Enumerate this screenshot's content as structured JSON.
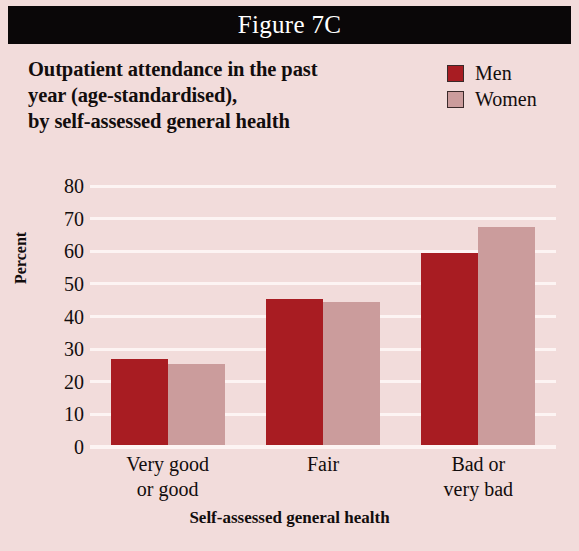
{
  "figure": {
    "banner_label": "Figure 7C",
    "banner_color": "#0a0708",
    "background_color": "#f2dcdb",
    "gridline_color": "#fdf4f3"
  },
  "title": {
    "line1": "Outpatient attendance in the past",
    "line2": "year (age-standardised),",
    "line3": "by self-assessed general health"
  },
  "legend": {
    "items": [
      {
        "label": "Men",
        "color": "#a81c22"
      },
      {
        "label": "Women",
        "color": "#cb9c9c"
      }
    ]
  },
  "axes": {
    "y_title": "Percent",
    "x_title": "Self-assessed general health",
    "y_ticks": [
      "0",
      "10",
      "20",
      "30",
      "40",
      "50",
      "60",
      "70",
      "80"
    ]
  },
  "categories_display": [
    {
      "line1": "Very good",
      "line2": "or good"
    },
    {
      "line1": "Fair",
      "line2": ""
    },
    {
      "line1": "Bad or",
      "line2": "very bad"
    }
  ],
  "chart_data": {
    "type": "bar",
    "title": "Outpatient attendance in the past year (age-standardised), by self-assessed general health",
    "xlabel": "Self-assessed general health",
    "ylabel": "Percent",
    "ylim": [
      0,
      80
    ],
    "ytick_step": 10,
    "grid": true,
    "legend_position": "top-right",
    "categories": [
      "Very good or good",
      "Fair",
      "Bad or very bad"
    ],
    "series": [
      {
        "name": "Men",
        "color": "#a81c22",
        "values": [
          27,
          45.5,
          59.5
        ]
      },
      {
        "name": "Women",
        "color": "#cb9c9c",
        "values": [
          25.5,
          44.5,
          67.5
        ]
      }
    ]
  }
}
